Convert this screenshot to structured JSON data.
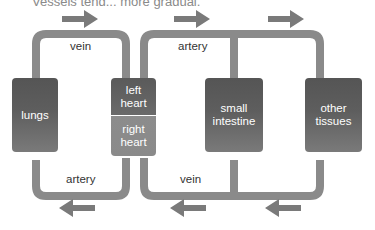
{
  "caption": "Vessels tend... more gradual.",
  "organs": {
    "lungs": "lungs",
    "left_heart": "left\nheart",
    "right_heart": "right\nheart",
    "small_intestine": "small\nintestine",
    "other_tissues": "other\ntissues"
  },
  "vessels": {
    "top_left": "vein",
    "top_right": "artery",
    "bottom_left": "artery",
    "bottom_right": "vein"
  },
  "arrows": {
    "top": [
      "right",
      "right",
      "right"
    ],
    "bottom": [
      "left",
      "left",
      "left"
    ]
  },
  "colors": {
    "pipe": "#8a8a8a",
    "arrow": "#7a7a7a",
    "box_dark": "#555555",
    "box_light": "#8c8c8c"
  }
}
